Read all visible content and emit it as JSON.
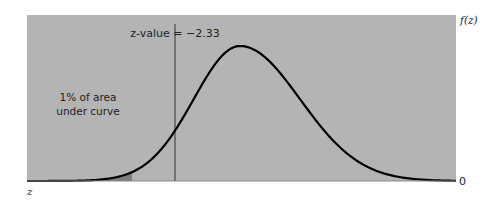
{
  "chart_data": {
    "type": "area",
    "title": "",
    "distribution": "standard normal",
    "xlabel": "z",
    "ylabel": "f(z)",
    "y_origin_label": "0",
    "critical_value": -2.33,
    "critical_label": "z-value = −2.33",
    "shaded_region": {
      "from": "-inf",
      "to": -2.33,
      "area_percent": 1
    },
    "annotation_lines": [
      "1% of area",
      "under curve"
    ],
    "mean": 0,
    "grid": false,
    "legend": "none"
  },
  "colors": {
    "panel": "#b4b4b4",
    "shaded": "#7d7d7d",
    "curve": "#000000",
    "critical_line": "#333333",
    "text": "#222222"
  }
}
